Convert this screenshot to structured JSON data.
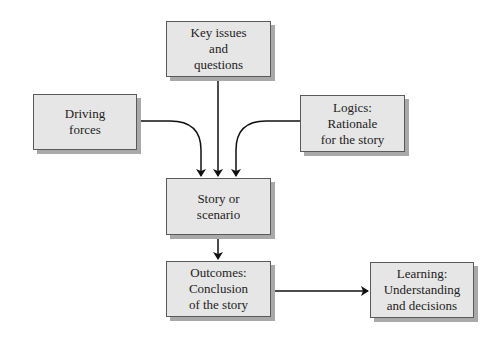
{
  "diagram": {
    "type": "flowchart",
    "nodes": [
      {
        "id": "key_issues",
        "lines": [
          "Key issues",
          "and",
          "questions"
        ]
      },
      {
        "id": "driving_forces",
        "lines": [
          "Driving",
          "forces"
        ]
      },
      {
        "id": "logics",
        "lines": [
          "Logics:",
          "Rationale",
          "for the story"
        ]
      },
      {
        "id": "story",
        "lines": [
          "Story or",
          "scenario"
        ]
      },
      {
        "id": "outcomes",
        "lines": [
          "Outcomes:",
          "Conclusion",
          "of the story"
        ]
      },
      {
        "id": "learning",
        "lines": [
          "Learning:",
          "Understanding",
          "and decisions"
        ]
      }
    ],
    "edges": [
      {
        "from": "key_issues",
        "to": "story"
      },
      {
        "from": "driving_forces",
        "to": "story"
      },
      {
        "from": "logics",
        "to": "story"
      },
      {
        "from": "story",
        "to": "outcomes"
      },
      {
        "from": "outcomes",
        "to": "learning"
      }
    ]
  }
}
